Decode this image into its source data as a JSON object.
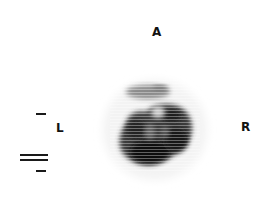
{
  "image": {
    "type": "grayscale nuclear medicine scan",
    "orientation_labels": {
      "anterior": "A",
      "left": "L",
      "right": "R"
    },
    "markers": {
      "left_dash": "single-dash",
      "scale_bars": "double-line-and-dash"
    },
    "colors": {
      "background": "#ffffff",
      "uptake_dark": "#0d0d0d",
      "uptake_mid": "#555555",
      "label": "#111111"
    }
  }
}
